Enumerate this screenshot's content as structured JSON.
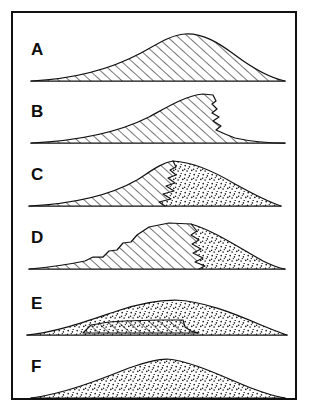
{
  "figure": {
    "frame": {
      "border_color": "#111111",
      "background": "#ffffff"
    },
    "ink_color": "#111111",
    "panel_count": 6
  },
  "legend_keys": {
    "hatched_label": "bedrock",
    "stippled_label": "regolith / weathered debris"
  },
  "panels": [
    {
      "id": "A",
      "label": "A",
      "label_x": 18,
      "label_y": 18,
      "materials": [
        "hatched"
      ],
      "description": "Smooth convex hill wholly in fresh bedrock; gentle left slope, rounded crest, steeper right slope.",
      "crest_x": 168,
      "crest_height": 46,
      "left_toe_x": 18,
      "right_toe_x": 272,
      "profile": "M 18,60 C 60,58 98,48 128,32 C 146,22 158,14 172,13 C 190,12 206,22 222,34 C 242,49 258,57 272,60",
      "scarps": []
    },
    {
      "id": "B",
      "label": "B",
      "label_x": 18,
      "label_y": 18,
      "materials": [
        "hatched"
      ],
      "description": "Same bedrock hill but the right flank has retreated into a steep serrated free face; crest shifted right.",
      "crest_x": 186,
      "crest_height": 48,
      "left_toe_x": 18,
      "right_toe_x": 272,
      "profile": "M 18,60 C 62,58 104,50 136,34 C 156,23 172,13 190,11 L 200,12 L 203,18 L 199,21 L 204,26 L 199,30 L 206,34 L 200,38 L 208,43 L 203,47 L 212,51 L 222,55 C 240,59 258,60 272,60",
      "scarps": []
    },
    {
      "id": "C",
      "label": "C",
      "label_x": 18,
      "label_y": 18,
      "materials": [
        "hatched",
        "stippled"
      ],
      "description": "Bedrock core with a stepped scarp on the right; a thin stippled debris apron banks against the lower right flank.",
      "crest_x": 150,
      "crest_height": 44,
      "left_toe_x": 16,
      "right_toe_x": 268,
      "profile": "M 16,60 C 56,58 96,50 124,34 C 138,25 148,17 160,15 C 180,16 202,26 222,38 C 240,48 256,56 268,60",
      "scarp_path": "M 160,15 L 163,21 L 157,24 L 163,29 L 155,32 L 162,37 L 153,40 L 161,45 L 150,48 L 158,53 L 146,56 L 152,60",
      "debris_region": "stippled wedge right of scarp, from x 150 to 268"
    },
    {
      "id": "D",
      "label": "D",
      "label_x": 18,
      "label_y": 18,
      "materials": [
        "hatched",
        "stippled"
      ],
      "description": "Bedrock core narrowed and flat-topped with notched left flank; a thick stippled debris wedge occupies the whole right side.",
      "crest_x": 140,
      "crest_height": 50,
      "left_toe_x": 16,
      "right_toe_x": 272,
      "profile": "M 16,60 C 38,58 58,55 72,52 L 80,48 L 90,48 L 96,42 L 104,41 L 110,34 L 118,33 L 124,26 L 136,18 L 156,14 L 178,15 C 202,22 228,40 250,52 C 260,57 266,59 272,60",
      "scarp_path": "M 178,15 L 184,22 L 178,26 L 186,31 L 179,35 L 188,40 L 180,44 L 190,49 L 182,53 L 192,57 L 186,60",
      "debris_region": "stippled wedge right of scarp, from x 178 to 272"
    },
    {
      "id": "E",
      "label": "E",
      "label_x": 18,
      "label_y": 18,
      "materials": [
        "stippled",
        "hatched"
      ],
      "description": "Only a small flat bedrock core remains, buried beneath a continuous stippled regolith mantle that forms the whole surface.",
      "crest_x": 150,
      "crest_height": 40,
      "left_toe_x": 14,
      "right_toe_x": 274,
      "profile": "M 14,60 C 44,57 74,46 104,36 C 124,29 142,25 162,25 C 190,26 220,38 248,50 C 260,55 268,58 274,60",
      "core_path": "M 70,58 L 78,50 L 96,47 L 112,46 L 146,45 L 170,45 L 172,52 L 178,56 L 186,58 Z",
      "debris_region": "stippled mantle enclosing the entire hill above the base line"
    },
    {
      "id": "F",
      "label": "F",
      "label_x": 18,
      "label_y": 18,
      "materials": [
        "stippled"
      ],
      "description": "Hill reduced entirely to stippled regolith; smooth convex dome with no bedrock exposed.",
      "crest_x": 140,
      "crest_height": 42,
      "left_toe_x": 18,
      "right_toe_x": 272,
      "profile": "M 18,60 C 50,56 86,42 116,30 C 130,25 142,21 154,21 C 178,23 208,38 238,50 C 254,56 264,59 272,60",
      "scarps": []
    }
  ]
}
